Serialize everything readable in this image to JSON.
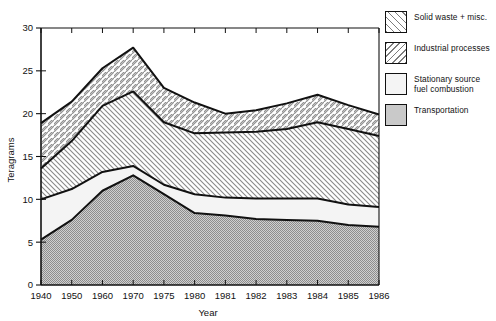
{
  "chart_data": {
    "type": "area",
    "stacked": true,
    "title": "",
    "xlabel": "Year",
    "ylabel": "Teragrams",
    "categories": [
      "1940",
      "1950",
      "1960",
      "1970",
      "1975",
      "1980",
      "1981",
      "1982",
      "1983",
      "1984",
      "1985",
      "1986"
    ],
    "ylim": [
      0,
      30
    ],
    "yticks": [
      0,
      5,
      10,
      15,
      20,
      25,
      30
    ],
    "grid": false,
    "legend_position": "right",
    "series": [
      {
        "name": "Transportation",
        "pattern": "fine-dot-gray",
        "color": "#a8a8a8",
        "values": [
          5.3,
          7.6,
          11.0,
          12.8,
          10.6,
          8.4,
          8.1,
          7.7,
          7.6,
          7.5,
          7.0,
          6.8
        ]
      },
      {
        "name": "Stationary source fuel combustion",
        "pattern": "plain-light",
        "color": "#f2f2f2",
        "values": [
          4.7,
          3.6,
          2.2,
          1.1,
          1.1,
          2.2,
          2.1,
          2.4,
          2.5,
          2.6,
          2.4,
          2.3
        ]
      },
      {
        "name": "Industrial processes",
        "pattern": "back-hatch",
        "color": "#d9d9d9",
        "values": [
          3.6,
          5.6,
          7.7,
          8.7,
          7.3,
          7.1,
          7.6,
          7.8,
          8.1,
          8.9,
          8.8,
          8.3
        ]
      },
      {
        "name": "Solid waste + misc.",
        "pattern": "forward-hatch",
        "color": "#e6e6e6",
        "values": [
          5.3,
          4.6,
          4.4,
          5.1,
          4.0,
          3.6,
          2.2,
          2.5,
          3.0,
          3.2,
          2.8,
          2.5
        ]
      }
    ],
    "cumulative_tops": {
      "transportation": [
        5.3,
        7.6,
        11.0,
        12.8,
        10.6,
        8.4,
        8.1,
        7.7,
        7.6,
        7.5,
        7.0,
        6.8
      ],
      "stationary_fuel": [
        10.0,
        11.2,
        13.2,
        13.9,
        11.7,
        10.6,
        10.2,
        10.1,
        10.1,
        10.1,
        9.4,
        9.1
      ],
      "industrial_processes": [
        13.6,
        16.8,
        20.9,
        22.6,
        19.0,
        17.7,
        17.8,
        17.9,
        18.2,
        19.0,
        18.2,
        17.4
      ],
      "total": [
        18.9,
        21.4,
        25.3,
        27.7,
        23.0,
        21.3,
        20.0,
        20.4,
        21.2,
        22.2,
        21.0,
        19.9
      ]
    }
  },
  "legend": {
    "items": [
      {
        "label": "Solid waste + misc."
      },
      {
        "label": "Industrial processes"
      },
      {
        "label": "Stationary source\nfuel combustion"
      },
      {
        "label": "Transportation"
      }
    ]
  },
  "axes": {
    "y_title": "Teragrams",
    "x_title": "Year"
  }
}
